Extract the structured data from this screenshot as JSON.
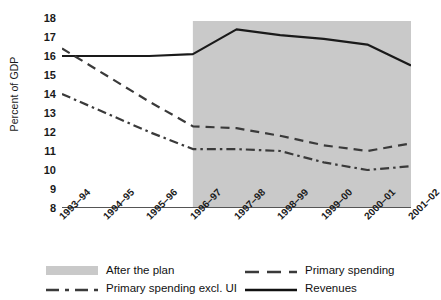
{
  "chart_data": {
    "type": "line",
    "title": "",
    "xlabel": "",
    "ylabel": "Percent of GDP",
    "categories": [
      "1993–94",
      "1994–95",
      "1995–96",
      "1996–97",
      "1997–98",
      "1998–99",
      "1999–00",
      "2000–01",
      "2001–02"
    ],
    "ylim": [
      8,
      18
    ],
    "yticks": [
      8,
      9,
      10,
      11,
      12,
      13,
      14,
      15,
      16,
      17,
      18
    ],
    "grid": false,
    "legend_position": "bottom",
    "shaded_region": {
      "label": "After the plan",
      "from": "1996–97",
      "to": "2001–02",
      "color": "#c9c9c9"
    },
    "series": [
      {
        "name": "Revenues",
        "style": "solid",
        "color": "#1a1a1a",
        "values": [
          16.0,
          16.0,
          16.0,
          16.1,
          17.4,
          17.1,
          16.9,
          16.6,
          15.5
        ]
      },
      {
        "name": "Primary spending",
        "style": "dashed",
        "color": "#3a3a3a",
        "values": [
          16.4,
          15.0,
          13.6,
          12.3,
          12.2,
          11.8,
          11.3,
          11.0,
          11.4
        ]
      },
      {
        "name": "Primary spending excl. UI",
        "style": "dash-dot",
        "color": "#3a3a3a",
        "values": [
          14.0,
          13.0,
          12.0,
          11.1,
          11.1,
          11.0,
          10.4,
          10.0,
          10.2
        ]
      }
    ]
  },
  "axis": {
    "y_label": "Percent of GDP",
    "y_ticks": [
      "18",
      "17",
      "16",
      "15",
      "14",
      "13",
      "12",
      "11",
      "10",
      "9",
      "8"
    ],
    "x_ticks": [
      "1993–94",
      "1994–95",
      "1995–96",
      "1996–97",
      "1997–98",
      "1998–99",
      "1999–00",
      "2000–01",
      "2001–02"
    ]
  },
  "legend": {
    "items": [
      {
        "label": "After the plan",
        "key": "shaded-swatch"
      },
      {
        "label": "Primary spending",
        "key": "dashed-line"
      },
      {
        "label": "Primary spending excl. UI",
        "key": "dash-dot-line"
      },
      {
        "label": "Revenues",
        "key": "solid-line"
      }
    ]
  }
}
